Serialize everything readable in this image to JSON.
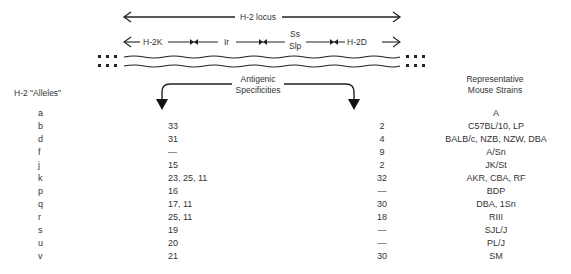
{
  "diagram": {
    "locus_label": "H-2 locus",
    "regions": [
      {
        "label": "H-2K"
      },
      {
        "label": "Ir"
      },
      {
        "label": "Ss"
      },
      {
        "label": "Slp"
      },
      {
        "label": "H-2D"
      }
    ],
    "antigenic_label_line1": "Antigenic",
    "antigenic_label_line2": "Specificities"
  },
  "table": {
    "headers": {
      "alleles": "H-2 \"Alleles\"",
      "strains_line1": "Representative",
      "strains_line2": "Mouse Strains"
    },
    "rows": [
      {
        "allele": "a",
        "k": "",
        "d": "",
        "strains": "A"
      },
      {
        "allele": "b",
        "k": "33",
        "d": "2",
        "strains": "C57BL/10, LP"
      },
      {
        "allele": "d",
        "k": "31",
        "d": "4",
        "strains": "BALB/c, NZB, NZW, DBA"
      },
      {
        "allele": "f",
        "k": "—",
        "d": "9",
        "strains": "A/Sn"
      },
      {
        "allele": "j",
        "k": "15",
        "d": "2",
        "strains": "JK/St"
      },
      {
        "allele": "k",
        "k": "23, 25, 11",
        "d": "32",
        "strains": "AKR, CBA, RF"
      },
      {
        "allele": "p",
        "k": "16",
        "d": "—",
        "strains": "BDP"
      },
      {
        "allele": "q",
        "k": "17, 11",
        "d": "30",
        "strains": "DBA, 1Sn"
      },
      {
        "allele": "r",
        "k": "25, 11",
        "d": "18",
        "strains": "RIII"
      },
      {
        "allele": "s",
        "k": "19",
        "d": "—",
        "strains": "SJL/J"
      },
      {
        "allele": "u",
        "k": "20",
        "d": "—",
        "strains": "PL/J"
      },
      {
        "allele": "v",
        "k": "21",
        "d": "30",
        "strains": "SM"
      }
    ]
  }
}
